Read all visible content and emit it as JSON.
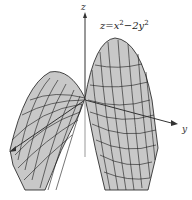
{
  "figure": {
    "equation": {
      "prefix": "z=x",
      "exp1": "2",
      "middle": "−2y",
      "exp2": "2"
    },
    "axes": {
      "x_label": "x",
      "y_label": "y",
      "z_label": "z"
    },
    "colors": {
      "surface_fill": "#c8c8c8",
      "mesh_line": "#1a1a1a",
      "axis": "#333333",
      "background": "#ffffff"
    }
  }
}
